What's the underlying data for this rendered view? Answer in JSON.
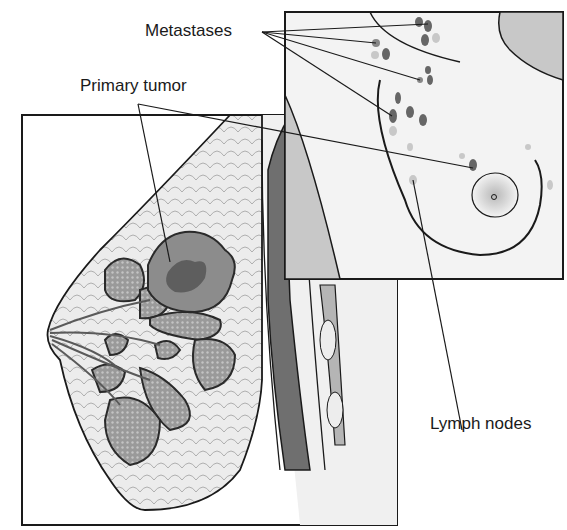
{
  "diagram": {
    "labels": {
      "metastases": "Metastases",
      "primary_tumor": "Primary tumor",
      "lymph_nodes": "Lymph nodes"
    },
    "panels": {
      "main": "breast-cross-section",
      "inset": "upper-body-front-view"
    },
    "colors": {
      "outline": "#1a1a1a",
      "tissue": "#e6e6e6",
      "lobule": "#9a9a9a",
      "tumor": "#8c8c8c",
      "tumor_core": "#5e5e5e",
      "muscle": "#6f6f6f",
      "node_dark": "#666666",
      "node_light": "#c8c8c8",
      "inset_bg": "#f3f3f3"
    }
  }
}
